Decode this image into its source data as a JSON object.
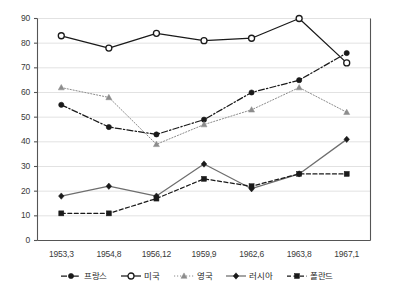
{
  "chart_data": {
    "type": "line",
    "title": "",
    "subtitle": "",
    "xlabel": "",
    "ylabel": "",
    "xlim": [
      0,
      6
    ],
    "ylim": [
      0,
      90
    ],
    "ytick_step": 10,
    "grid": true,
    "grid_axis": "y",
    "legend_position": "bottom",
    "categories": [
      "1953,3",
      "1954,8",
      "1956,12",
      "1959,9",
      "1962,6",
      "1963,8",
      "1967,1"
    ],
    "yticks": [
      "0",
      "10",
      "20",
      "30",
      "40",
      "50",
      "60",
      "70",
      "80",
      "90"
    ],
    "series": [
      {
        "name": "프랑스",
        "marker": "filled-circle",
        "line_style": "dashdot",
        "color": "#1a1a1a",
        "values": [
          55,
          46,
          43,
          49,
          60,
          65,
          76
        ]
      },
      {
        "name": "미국",
        "marker": "open-circle",
        "line_style": "solid",
        "color": "#1a1a1a",
        "values": [
          83,
          78,
          84,
          81,
          82,
          90,
          72
        ]
      },
      {
        "name": "영국",
        "marker": "filled-triangle",
        "line_style": "dotted",
        "color": "#8c8c8c",
        "values": [
          62,
          58,
          39,
          47,
          53,
          62,
          52
        ]
      },
      {
        "name": "러시아",
        "marker": "filled-diamond",
        "line_style": "solid",
        "color": "#6e6e6e",
        "values": [
          18,
          22,
          18,
          31,
          21,
          27,
          41
        ]
      },
      {
        "name": "폴란드",
        "marker": "filled-square",
        "line_style": "dashed",
        "color": "#1a1a1a",
        "values": [
          11,
          11,
          17,
          25,
          22,
          27,
          27
        ]
      }
    ]
  },
  "axes": {
    "frame_color": "#555555",
    "grid_color": "#e2e2e2"
  }
}
